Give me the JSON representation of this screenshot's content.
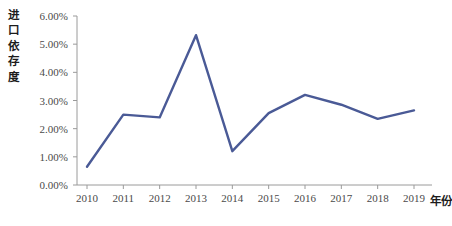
{
  "chart_data": {
    "type": "line",
    "title": "",
    "subtitle": "",
    "xlabel": "年份",
    "ylabel": "进口依存度",
    "ylabel_chars": [
      "进",
      "口",
      "依",
      "存",
      "度"
    ],
    "categories": [
      "2010",
      "2011",
      "2012",
      "2013",
      "2014",
      "2015",
      "2016",
      "2017",
      "2018",
      "2019"
    ],
    "x": [
      2010,
      2011,
      2012,
      2013,
      2014,
      2015,
      2016,
      2017,
      2018,
      2019
    ],
    "values": [
      0.65,
      2.5,
      2.4,
      5.32,
      1.2,
      2.55,
      3.2,
      2.85,
      2.35,
      2.65
    ],
    "value_labels": [
      "0.65%",
      "2.50%",
      "2.40%",
      "5.32%",
      "1.20%",
      "2.55%",
      "3.20%",
      "2.85%",
      "2.35%",
      "2.65%"
    ],
    "ylim": [
      0,
      6
    ],
    "y_ticks": [
      0,
      1,
      2,
      3,
      4,
      5,
      6
    ],
    "y_tick_labels": [
      "0.00%",
      "1.00%",
      "2.00%",
      "3.00%",
      "4.00%",
      "5.00%",
      "6.00%"
    ],
    "grid": false,
    "legend": null,
    "legend_position": "none",
    "series": [
      {
        "name": "进口依存度",
        "color": "#4a5a96",
        "values": [
          0.65,
          2.5,
          2.4,
          5.32,
          1.2,
          2.55,
          3.2,
          2.85,
          2.35,
          2.65
        ]
      }
    ],
    "annotations": []
  },
  "axes": {
    "line_color": "#4a5a96",
    "axis_color": "#9a9a9a",
    "tick_color": "#9a9a9a",
    "background": "#ffffff"
  }
}
